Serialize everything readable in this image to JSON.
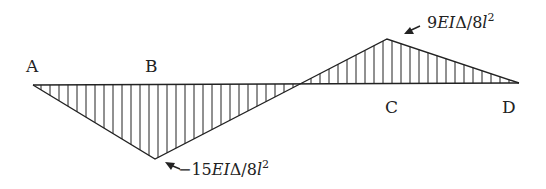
{
  "diagram": {
    "type": "bending-moment-diagram",
    "points": {
      "A": {
        "label": "A"
      },
      "B": {
        "label": "B"
      },
      "C": {
        "label": "C"
      },
      "D": {
        "label": "D"
      }
    },
    "annotations": {
      "negative_peak": {
        "coef": "−15",
        "ei": "EI",
        "delta": "Δ/8",
        "l": "l",
        "exp": "2"
      },
      "positive_peak": {
        "coef": "9",
        "ei": "EI",
        "delta": "Δ/8",
        "l": "l",
        "exp": "2"
      }
    },
    "colors": {
      "line": "#222222",
      "background": "#ffffff"
    }
  }
}
